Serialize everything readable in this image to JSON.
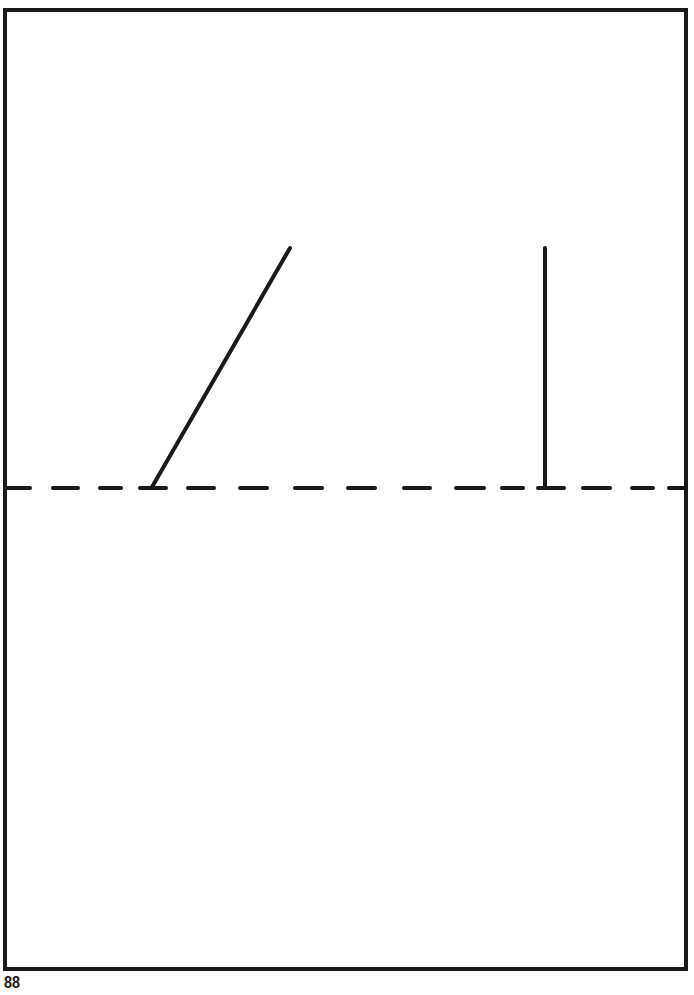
{
  "page": {
    "page_number": "88",
    "background_color": "#ffffff",
    "ink_color": "#1a1a1a"
  },
  "figure": {
    "frame": {
      "x": 5,
      "y": 10,
      "width": 681,
      "height": 959,
      "stroke_width": 4
    },
    "dashed_baseline": {
      "y": 488,
      "stroke_width": 4,
      "dashes": [
        [
          6,
          30
        ],
        [
          53,
          78
        ],
        [
          100,
          121
        ],
        [
          140,
          166
        ],
        [
          188,
          214
        ],
        [
          240,
          267
        ],
        [
          295,
          322
        ],
        [
          348,
          375
        ],
        [
          404,
          430
        ],
        [
          456,
          484
        ],
        [
          502,
          523
        ],
        [
          538,
          564
        ],
        [
          583,
          610
        ],
        [
          632,
          653
        ],
        [
          669,
          686
        ]
      ]
    },
    "lines": [
      {
        "name": "slanted-line",
        "x1": 152,
        "y1": 487,
        "x2": 290,
        "y2": 248,
        "stroke_width": 4
      },
      {
        "name": "vertical-line",
        "x1": 545,
        "y1": 487,
        "x2": 545,
        "y2": 248,
        "stroke_width": 4
      }
    ]
  }
}
